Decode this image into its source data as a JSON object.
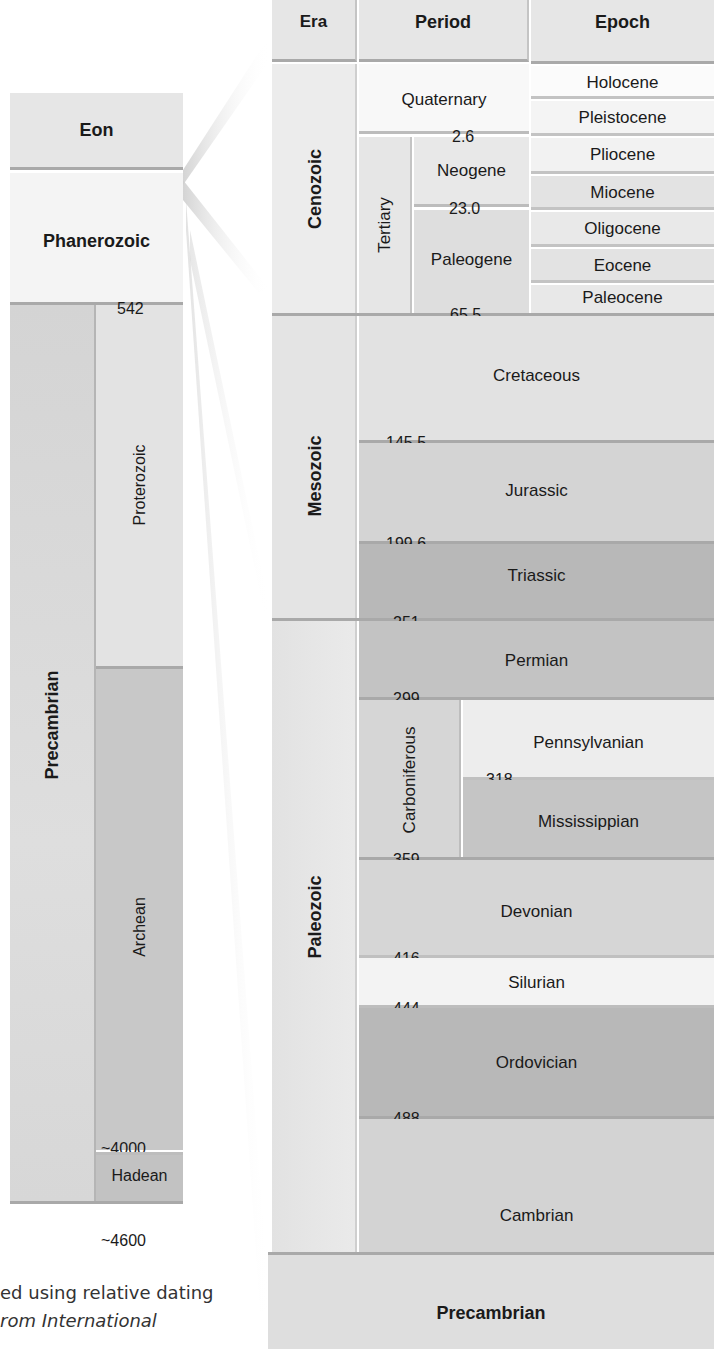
{
  "headers": {
    "eon": "Eon",
    "era": "Era",
    "period": "Period",
    "epoch": "Epoch"
  },
  "left_column": {
    "phanerozoic": "Phanerozoic",
    "precambrian": "Precambrian",
    "proterozoic": "Proterozoic",
    "archean": "Archean",
    "hadean": "Hadean",
    "ages": {
      "a542": "542",
      "a2500": "2500",
      "a4000": "~4000",
      "a4600": "~4600"
    }
  },
  "eras": {
    "cenozoic": "Cenozoic",
    "mesozoic": "Mesozoic",
    "paleozoic": "Paleozoic",
    "precambrian": "Precambrian"
  },
  "periods": {
    "quaternary": "Quaternary",
    "tertiary": "Tertiary",
    "neogene": "Neogene",
    "paleogene": "Paleogene",
    "cretaceous": "Cretaceous",
    "jurassic": "Jurassic",
    "triassic": "Triassic",
    "permian": "Permian",
    "carboniferous": "Carboniferous",
    "pennsylvanian": "Pennsylvanian",
    "mississippian": "Mississippian",
    "devonian": "Devonian",
    "silurian": "Silurian",
    "ordovician": "Ordovician",
    "cambrian": "Cambrian"
  },
  "epochs": [
    "Holocene",
    "Pleistocene",
    "Pliocene",
    "Miocene",
    "Oligocene",
    "Eocene",
    "Paleocene"
  ],
  "ages": {
    "a2_6": "2.6",
    "a23_0": "23.0",
    "a65_5": "65.5",
    "a145_5": "145.5",
    "a199_6": "199.6",
    "a251": "251",
    "a299": "299",
    "a318": "318",
    "a359": "359",
    "a416": "416",
    "a444": "444",
    "a488": "488",
    "a542": "542"
  },
  "caption": {
    "line1": "ed using relative dating",
    "line2": "rom International"
  },
  "colors": {
    "header": "#e6e6e6",
    "lightest": "#f6f6f6",
    "light": "#e9e9e9",
    "mid": "#d6d6d6",
    "midDark": "#c9c9c9",
    "dark": "#b9b9b9"
  }
}
